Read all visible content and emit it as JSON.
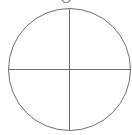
{
  "diagram": {
    "type": "circle-with-crosshair",
    "top_label": "O",
    "stroke_color": "#6e6e6e",
    "background": "#ffffff",
    "circle": {
      "cx": 69.5,
      "cy": 69.5,
      "r": 61
    },
    "vertical_line": {
      "x": 69.5,
      "y1": 8.5,
      "y2": 130.5
    },
    "horizontal_line": {
      "y": 69.5,
      "x1": 8.5,
      "x2": 130.5
    }
  }
}
